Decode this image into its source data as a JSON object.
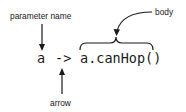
{
  "labels": {
    "parameter_name": "parameter name",
    "body": "body",
    "arrow": "arrow"
  },
  "code": {
    "parameter": "a",
    "arrow_token": "->",
    "body_expression": "a.canHop()"
  },
  "colors": {
    "ink": "#1a1a1a",
    "background": "#ffffff"
  }
}
